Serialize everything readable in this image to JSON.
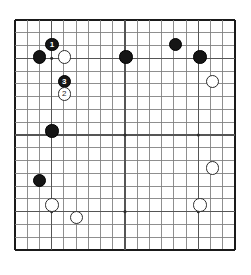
{
  "diagram": {
    "kind": "go-board-diagram",
    "title": "",
    "board_size": 19,
    "colors": {
      "background": "#ffffff",
      "board_fill": "#ffffff",
      "grid_line": "#7d7d7d",
      "grid_line_strong": "#3a3a3a",
      "border": "#1a1a1a",
      "black_stone": "#151515",
      "white_stone": "#ffffff",
      "white_stone_edge": "#2b2b2b",
      "star_point": "#2a2a2a"
    },
    "geometry": {
      "origin_x": 14,
      "origin_y": 19,
      "spacing": 12.33,
      "stone_diameter": 13.4,
      "star_radius": 1.5,
      "border_width": 1.6
    },
    "star_points": [
      {
        "col": 3,
        "row": 3
      },
      {
        "col": 9,
        "row": 3
      },
      {
        "col": 15,
        "row": 3
      },
      {
        "col": 3,
        "row": 9
      },
      {
        "col": 9,
        "row": 9
      },
      {
        "col": 15,
        "row": 9
      },
      {
        "col": 3,
        "row": 15
      },
      {
        "col": 9,
        "row": 15
      },
      {
        "col": 15,
        "row": 15
      }
    ],
    "stones": [
      {
        "col": 3,
        "row": 2,
        "color": "black",
        "label": "1"
      },
      {
        "col": 2,
        "row": 3,
        "color": "black",
        "label": ""
      },
      {
        "col": 4,
        "row": 3,
        "color": "white",
        "label": ""
      },
      {
        "col": 9,
        "row": 3,
        "color": "black",
        "label": ""
      },
      {
        "col": 13,
        "row": 2,
        "color": "black",
        "label": ""
      },
      {
        "col": 15,
        "row": 3,
        "color": "black",
        "label": ""
      },
      {
        "col": 4,
        "row": 5,
        "color": "black",
        "label": "3"
      },
      {
        "col": 4,
        "row": 6,
        "color": "white",
        "label": "2"
      },
      {
        "col": 16,
        "row": 5,
        "color": "white",
        "label": ""
      },
      {
        "col": 3,
        "row": 9,
        "color": "black",
        "label": ""
      },
      {
        "col": 16,
        "row": 12,
        "color": "white",
        "label": ""
      },
      {
        "col": 2,
        "row": 13,
        "color": "black",
        "label": ""
      },
      {
        "col": 3,
        "row": 15,
        "color": "white",
        "label": ""
      },
      {
        "col": 5,
        "row": 16,
        "color": "white",
        "label": ""
      },
      {
        "col": 15,
        "row": 15,
        "color": "white",
        "label": ""
      }
    ]
  }
}
